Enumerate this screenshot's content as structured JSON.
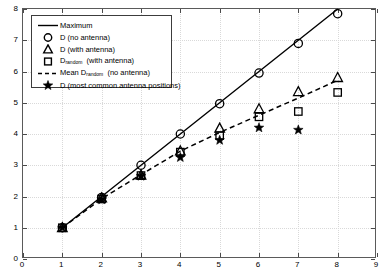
{
  "chart_data": {
    "type": "scatter",
    "title": "",
    "xlabel": "",
    "ylabel": "",
    "xlim": [
      0,
      9
    ],
    "ylim": [
      0,
      8
    ],
    "xticks": [
      0,
      1,
      2,
      3,
      4,
      5,
      6,
      7,
      8,
      9
    ],
    "yticks": [
      0,
      1,
      2,
      3,
      4,
      5,
      6,
      7,
      8
    ],
    "xticklabels": [
      "0",
      "1",
      "2",
      "3",
      "4",
      "5",
      "6",
      "7",
      "8",
      "9"
    ],
    "yticklabels": [
      "0",
      "1",
      "2",
      "3",
      "4",
      "5",
      "6",
      "7",
      "8"
    ],
    "grid": true,
    "legend_position": "upper left",
    "x": [
      1,
      2,
      3,
      4,
      5,
      6,
      7,
      8
    ],
    "series": [
      {
        "name": "Maximum",
        "marker": "line",
        "style": "solid",
        "values": [
          1.0,
          2.0,
          3.0,
          4.0,
          5.0,
          6.0,
          7.0,
          8.0
        ]
      },
      {
        "name": "D (no antenna)",
        "marker": "circle",
        "values": [
          1.0,
          1.97,
          3.0,
          4.0,
          4.97,
          5.95,
          6.9,
          7.85
        ]
      },
      {
        "name": "D (with antenna)",
        "marker": "triangle",
        "values": [
          1.0,
          1.95,
          2.68,
          3.45,
          4.18,
          4.8,
          5.35,
          5.8
        ]
      },
      {
        "name": "D_random (with antenna)",
        "marker": "square",
        "values": [
          1.0,
          1.92,
          2.67,
          3.42,
          3.95,
          4.55,
          4.72,
          5.33
        ]
      },
      {
        "name": "Mean D_random (no antenna)",
        "marker": "dashed-line",
        "style": "dashed",
        "values": [
          1.0,
          1.93,
          2.7,
          3.45,
          4.05,
          4.6,
          5.15,
          5.72
        ]
      },
      {
        "name": "D (most common antenna positions)",
        "marker": "star",
        "values": [
          1.0,
          1.9,
          2.65,
          3.25,
          3.8,
          4.2,
          4.13,
          null
        ]
      }
    ]
  },
  "legend": {
    "items": [
      {
        "label": "Maximum",
        "symbol": "line",
        "sub": "",
        "suffix": ""
      },
      {
        "label": "D (no antenna)",
        "symbol": "circle",
        "sub": "",
        "suffix": ""
      },
      {
        "label": "D (with antenna)",
        "symbol": "triangle",
        "sub": "",
        "suffix": ""
      },
      {
        "label": "D",
        "symbol": "square",
        "sub": "random",
        "suffix": "(with antenna)"
      },
      {
        "label": "Mean D",
        "symbol": "dashed",
        "sub": "random",
        "suffix": "(no antenna)"
      },
      {
        "label": "D (most common antenna positions)",
        "symbol": "star",
        "sub": "",
        "suffix": ""
      }
    ]
  },
  "colors": {
    "line": "#000000",
    "marker": "#000000",
    "axis": "#5a5a5a",
    "grid": "#d9d9d9",
    "background": "#ffffff"
  }
}
